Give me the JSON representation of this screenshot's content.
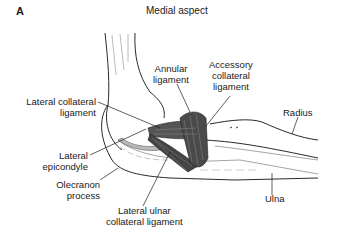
{
  "figure": {
    "panel_letter": "A",
    "title": "Medial aspect"
  },
  "labels": {
    "annular_ligament": [
      "Annular",
      "ligament"
    ],
    "accessory_collateral_ligament": [
      "Accessory",
      "collateral",
      "ligament"
    ],
    "lateral_collateral_ligament": [
      "Lateral collateral",
      "ligament"
    ],
    "radius": "Radius",
    "lateral_epicondyle": [
      "Lateral",
      "epicondyle"
    ],
    "olecranon_process": [
      "Olecranon",
      "process"
    ],
    "lateral_ulnar_collateral_ligament": [
      "Lateral ulnar",
      "collateral ligament"
    ],
    "ulna": "Ulna"
  },
  "colors": {
    "line": "#2a2a2a",
    "ligament_fill": "#4a4a4a",
    "background": "#ffffff"
  }
}
